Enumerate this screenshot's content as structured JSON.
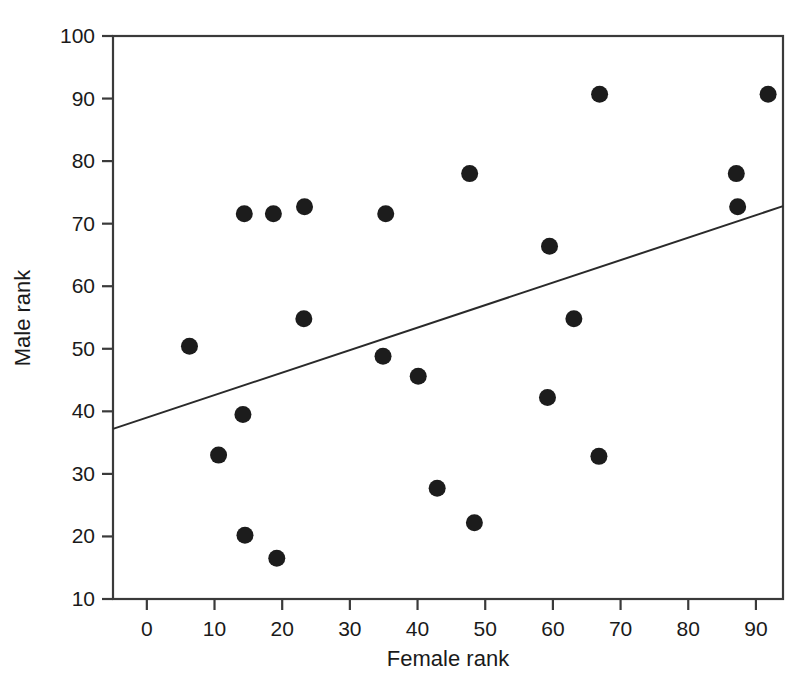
{
  "chart_data": {
    "type": "scatter",
    "title": "",
    "xlabel": "Female rank",
    "ylabel": "Male rank",
    "xlim": [
      -5,
      94
    ],
    "ylim": [
      10,
      100
    ],
    "xticks": [
      0,
      10,
      20,
      30,
      40,
      50,
      60,
      70,
      80,
      90
    ],
    "yticks": [
      10,
      20,
      30,
      40,
      50,
      60,
      70,
      80,
      90,
      100
    ],
    "xtick_labels": [
      "0",
      "10",
      "20",
      "30",
      "40",
      "50",
      "60",
      "70",
      "80",
      "90"
    ],
    "ytick_labels": [
      "10",
      "20",
      "30",
      "40",
      "50",
      "60",
      "70",
      "80",
      "90",
      "100"
    ],
    "grid": false,
    "legend": "none",
    "marker": "filled-circle",
    "marker_color": "#1c1c1c",
    "line_color": "#2a2a2a",
    "axis_color": "#3a3a3a",
    "background": "#ffffff",
    "points": [
      {
        "x": 6.3,
        "y": 50.4
      },
      {
        "x": 10.6,
        "y": 33.0
      },
      {
        "x": 14.4,
        "y": 71.6
      },
      {
        "x": 14.2,
        "y": 39.5
      },
      {
        "x": 14.5,
        "y": 20.2
      },
      {
        "x": 18.7,
        "y": 71.6
      },
      {
        "x": 19.2,
        "y": 16.5
      },
      {
        "x": 23.3,
        "y": 72.7
      },
      {
        "x": 23.2,
        "y": 54.8
      },
      {
        "x": 34.9,
        "y": 48.8
      },
      {
        "x": 35.3,
        "y": 71.6
      },
      {
        "x": 40.1,
        "y": 45.6
      },
      {
        "x": 42.9,
        "y": 27.7
      },
      {
        "x": 47.7,
        "y": 78.0
      },
      {
        "x": 48.4,
        "y": 22.2
      },
      {
        "x": 59.2,
        "y": 42.2
      },
      {
        "x": 59.5,
        "y": 66.4
      },
      {
        "x": 63.1,
        "y": 54.8
      },
      {
        "x": 66.9,
        "y": 90.7
      },
      {
        "x": 66.8,
        "y": 32.8
      },
      {
        "x": 87.1,
        "y": 78.0
      },
      {
        "x": 87.3,
        "y": 72.7
      },
      {
        "x": 91.8,
        "y": 90.7
      }
    ],
    "trend_line": {
      "x_start": -5,
      "y_start": 37.2,
      "x_end": 94,
      "y_end": 72.8,
      "slope": 0.36,
      "intercept": 39.0
    }
  }
}
